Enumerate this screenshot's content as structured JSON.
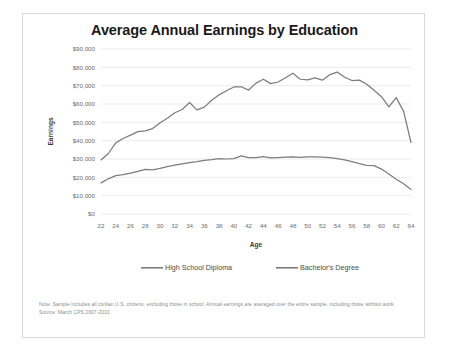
{
  "card": {
    "footnote": "Note: Sample includes all civilian U.S. citizens, excluding those in school. Annual earnings are averaged over the entire sample, including those without work. Source: March CPS 2007-2010."
  },
  "chart_data": {
    "type": "line",
    "title": "Average Annual Earnings by Education",
    "xlabel": "Age",
    "ylabel": "Earnings",
    "xlim": [
      22,
      64
    ],
    "ylim": [
      0,
      90000
    ],
    "grid": true,
    "legend_position": "bottom",
    "x": [
      22,
      23,
      24,
      25,
      26,
      27,
      28,
      29,
      30,
      31,
      32,
      33,
      34,
      35,
      36,
      37,
      38,
      39,
      40,
      41,
      42,
      43,
      44,
      45,
      46,
      47,
      48,
      49,
      50,
      51,
      52,
      53,
      54,
      55,
      56,
      57,
      58,
      59,
      60,
      61,
      62,
      63,
      64
    ],
    "xticks": [
      22,
      24,
      26,
      28,
      30,
      32,
      34,
      36,
      38,
      40,
      42,
      44,
      46,
      48,
      50,
      52,
      54,
      56,
      58,
      60,
      62,
      64
    ],
    "yticks": [
      0,
      10000,
      20000,
      30000,
      40000,
      50000,
      60000,
      70000,
      80000,
      90000
    ],
    "ytick_labels": [
      "$0",
      "$10,000",
      "$20,000",
      "$30,000",
      "$40,000",
      "$50,000",
      "$60,000",
      "$70,000",
      "$80,000",
      "$90,000"
    ],
    "series": [
      {
        "name": "High School Diploma",
        "color": "#7d7d7d",
        "values": [
          17000,
          19200,
          20900,
          21500,
          22300,
          23300,
          24300,
          24100,
          24900,
          25800,
          26600,
          27400,
          28000,
          28600,
          29300,
          29700,
          30200,
          30000,
          30200,
          31700,
          30700,
          30800,
          31300,
          30600,
          30800,
          31000,
          31100,
          30900,
          31100,
          31100,
          31000,
          30800,
          30200,
          29500,
          28600,
          27500,
          26500,
          26400,
          24500,
          21800,
          19000,
          16500,
          13400
        ]
      },
      {
        "name": "Bachelor's Degree",
        "color": "#7d7d7d",
        "values": [
          29500,
          33000,
          38800,
          41200,
          43000,
          44900,
          45300,
          46600,
          49800,
          52200,
          55200,
          57000,
          60800,
          56800,
          58300,
          62000,
          65000,
          67200,
          69300,
          69400,
          67600,
          71400,
          73500,
          71100,
          72000,
          74300,
          76800,
          73500,
          73200,
          74200,
          73000,
          76000,
          77400,
          74600,
          72800,
          73000,
          70800,
          67500,
          64000,
          58400,
          63500,
          56000,
          39000
        ]
      }
    ]
  }
}
